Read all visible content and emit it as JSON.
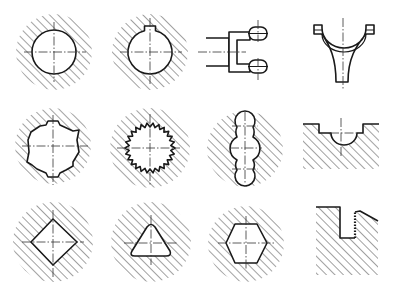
{
  "figure": {
    "colors": {
      "line": "#1a1a1a",
      "hatch": "#444444",
      "background": "#ffffff"
    },
    "cells": [
      {
        "row": 1,
        "col": 1,
        "shape": "round-hole-section"
      },
      {
        "row": 1,
        "col": 2,
        "shape": "keyed-round-hole-section"
      },
      {
        "row": 1,
        "col": 3,
        "shape": "clevis-fork"
      },
      {
        "row": 1,
        "col": 4,
        "shape": "shift-fork"
      },
      {
        "row": 2,
        "col": 1,
        "shape": "splined-hole-section"
      },
      {
        "row": 2,
        "col": 2,
        "shape": "serrated-hole-section"
      },
      {
        "row": 2,
        "col": 3,
        "shape": "triple-lobe-slot-section"
      },
      {
        "row": 2,
        "col": 4,
        "shape": "stepped-groove-with-round-bottom"
      },
      {
        "row": 3,
        "col": 1,
        "shape": "square-hole-section"
      },
      {
        "row": 3,
        "col": 2,
        "shape": "triangular-hole-section"
      },
      {
        "row": 3,
        "col": 3,
        "shape": "hexagonal-hole-section"
      },
      {
        "row": 3,
        "col": 4,
        "shape": "slot-with-knurled-edge"
      }
    ]
  }
}
